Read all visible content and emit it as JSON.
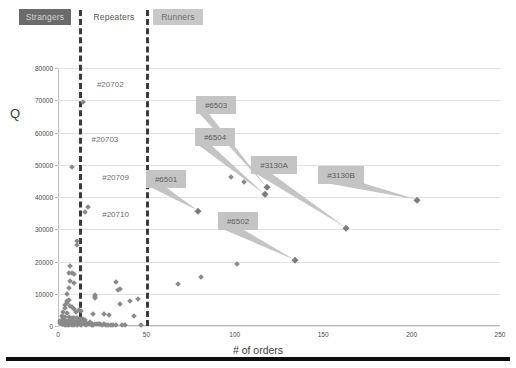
{
  "categories": {
    "strangers": "Strangers",
    "repeaters": "Repeaters",
    "runners": "Runners"
  },
  "chart_data": {
    "type": "scatter",
    "title": "",
    "xlabel": "# of orders",
    "ylabel": "Q",
    "xlim": [
      0,
      250
    ],
    "ylim": [
      0,
      80000
    ],
    "xticks": [
      0,
      50,
      100,
      150,
      200,
      250
    ],
    "yticks": [
      0,
      10000,
      20000,
      30000,
      40000,
      50000,
      60000,
      70000,
      80000
    ],
    "grid": "horizontal",
    "legend": "none",
    "dividers": [
      {
        "x": 12,
        "label": "Strangers/Repeaters boundary"
      },
      {
        "x": 50,
        "label": "Repeaters/Runners boundary"
      }
    ],
    "points": [
      [
        14,
        69500
      ],
      [
        8,
        49200
      ],
      [
        15,
        35200
      ],
      [
        17,
        37000
      ],
      [
        11,
        26500
      ],
      [
        11,
        25200
      ],
      [
        7,
        18500
      ],
      [
        6,
        16400
      ],
      [
        8,
        16300
      ],
      [
        9,
        16200
      ],
      [
        7,
        13900
      ],
      [
        9,
        13400
      ],
      [
        33,
        13500
      ],
      [
        35,
        11400
      ],
      [
        34,
        11200
      ],
      [
        6,
        11700
      ],
      [
        5,
        9900
      ],
      [
        21,
        9600
      ],
      [
        21,
        9100
      ],
      [
        21,
        8600
      ],
      [
        45,
        8400
      ],
      [
        41,
        7900
      ],
      [
        35,
        6800
      ],
      [
        6,
        8000
      ],
      [
        5,
        7600
      ],
      [
        5,
        7100
      ],
      [
        4,
        6500
      ],
      [
        7,
        6200
      ],
      [
        8,
        5900
      ],
      [
        4,
        5500
      ],
      [
        9,
        5200
      ],
      [
        12,
        5000
      ],
      [
        13,
        4700
      ],
      [
        10,
        4400
      ],
      [
        3,
        4300
      ],
      [
        5,
        4100
      ],
      [
        20,
        3700
      ],
      [
        26,
        3600
      ],
      [
        29,
        3400
      ],
      [
        43,
        3200
      ],
      [
        2,
        3100
      ],
      [
        3,
        2900
      ],
      [
        4,
        2800
      ],
      [
        6,
        2700
      ],
      [
        8,
        2600
      ],
      [
        9,
        2500
      ],
      [
        11,
        2400
      ],
      [
        12,
        2300
      ],
      [
        13,
        2200
      ],
      [
        14,
        2100
      ],
      [
        15,
        2000
      ],
      [
        2,
        1900
      ],
      [
        3,
        1800
      ],
      [
        4,
        1700
      ],
      [
        5,
        1600
      ],
      [
        6,
        1500
      ],
      [
        7,
        1400
      ],
      [
        8,
        1300
      ],
      [
        9,
        1200
      ],
      [
        10,
        1100
      ],
      [
        11,
        1000
      ],
      [
        12,
        950
      ],
      [
        13,
        900
      ],
      [
        14,
        850
      ],
      [
        16,
        800
      ],
      [
        17,
        750
      ],
      [
        18,
        700
      ],
      [
        19,
        650
      ],
      [
        21,
        600
      ],
      [
        22,
        560
      ],
      [
        24,
        520
      ],
      [
        26,
        480
      ],
      [
        28,
        450
      ],
      [
        31,
        420
      ],
      [
        33,
        400
      ],
      [
        36,
        380
      ],
      [
        1,
        1450
      ],
      [
        1,
        900
      ],
      [
        2,
        700
      ],
      [
        2,
        480
      ],
      [
        3,
        1150
      ],
      [
        3,
        620
      ],
      [
        4,
        950
      ],
      [
        4,
        350
      ],
      [
        5,
        1250
      ],
      [
        5,
        420
      ],
      [
        6,
        720
      ],
      [
        6,
        300
      ],
      [
        7,
        1050
      ],
      [
        7,
        520
      ],
      [
        8,
        880
      ],
      [
        8,
        330
      ],
      [
        9,
        760
      ],
      [
        9,
        280
      ],
      [
        10,
        1350
      ],
      [
        10,
        600
      ],
      [
        11,
        450
      ],
      [
        12,
        1550
      ],
      [
        12,
        700
      ],
      [
        13,
        380
      ],
      [
        14,
        1250
      ],
      [
        15,
        560
      ],
      [
        16,
        320
      ],
      [
        18,
        1150
      ],
      [
        19,
        430
      ],
      [
        20,
        260
      ],
      [
        23,
        620
      ],
      [
        25,
        300
      ],
      [
        27,
        270
      ],
      [
        30,
        250
      ],
      [
        38,
        240
      ],
      [
        47,
        230
      ],
      [
        68,
        13000
      ],
      [
        81,
        15100
      ],
      [
        101,
        19300
      ],
      [
        98,
        46100
      ],
      [
        105,
        44700
      ]
    ],
    "labeled_points": [
      {
        "id": "#6503",
        "x": 118,
        "y": 43100
      },
      {
        "id": "#6504",
        "x": 117,
        "y": 40800
      },
      {
        "id": "#6501",
        "x": 79,
        "y": 35800
      },
      {
        "id": "#3130A",
        "x": 163,
        "y": 30500
      },
      {
        "id": "#3130B",
        "x": 203,
        "y": 39200
      },
      {
        "id": "#6502",
        "x": 134,
        "y": 20500
      }
    ],
    "text_annotations": [
      {
        "id": "#20702",
        "x": 22,
        "y": 74500
      },
      {
        "id": "#20703",
        "x": 19,
        "y": 57500
      },
      {
        "id": "#20709",
        "x": 25,
        "y": 45500
      },
      {
        "id": "#20710",
        "x": 25,
        "y": 34000
      }
    ]
  },
  "colors": {
    "marker": "#8a8a8a",
    "divider": "#3b3b3b",
    "callout_bg": "#c4c4c4",
    "strangers_bg": "#6b6b6b",
    "runners_bg": "#c8c8c8",
    "grid": "#e3e3e3"
  }
}
